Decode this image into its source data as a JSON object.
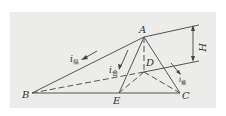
{
  "diagram": {
    "points": {
      "A": {
        "label": "A"
      },
      "B": {
        "label": "B"
      },
      "C": {
        "label": "C"
      },
      "D": {
        "label": "D"
      },
      "E": {
        "label": "E"
      }
    },
    "dimension": {
      "label": "H"
    },
    "slopes": {
      "longitudinal": {
        "main": "i",
        "sub": "纵"
      },
      "resultant": {
        "main": "i",
        "sub": "合"
      },
      "transverse": {
        "main": "i",
        "sub": "横"
      }
    },
    "colors": {
      "line": "#555555",
      "background": "#ececea"
    }
  }
}
